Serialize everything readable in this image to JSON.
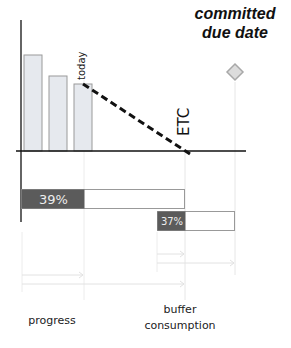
{
  "diagram": {
    "labels": {
      "due_date": "committed due date",
      "due_line1": "committed",
      "due_line2": "due date",
      "today": "today",
      "etc": "ETC",
      "progress": "progress",
      "buffer_line1": "buffer",
      "buffer_line2": "consumption"
    },
    "bars": [
      {
        "name": "bar-1",
        "relative_height": 96
      },
      {
        "name": "bar-2",
        "relative_height": 75
      },
      {
        "name": "bar-3",
        "relative_height": 67
      }
    ],
    "progress_bar": {
      "value_label": "39%",
      "percent": 39
    },
    "buffer_bar": {
      "value_label": "37%",
      "percent": 37
    },
    "colors": {
      "bar_fill": "#e6e9ee",
      "bar_stroke": "#9a9a9a",
      "dark_fill": "#5b5b5b",
      "axis": "#111111",
      "guide": "#e4e4e4",
      "diamond_fill": "#dcdcdc",
      "diamond_stroke": "#a8a8a8"
    }
  }
}
